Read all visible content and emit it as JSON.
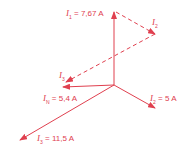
{
  "diagram": {
    "title": "",
    "color": "#e0404f",
    "origin": [
      114,
      85
    ],
    "vectors": [
      {
        "name": "I1",
        "label_sym": "I",
        "label_sub": "1",
        "value": "= 7,67 A",
        "end": [
          114,
          12
        ],
        "style": "solid"
      },
      {
        "name": "I2",
        "label_sym": "I",
        "label_sub": "2",
        "value": "= 5 A",
        "end": [
          155,
          108
        ],
        "style": "solid"
      },
      {
        "name": "I3",
        "label_sym": "I",
        "label_sub": "3",
        "value": "= 11,5 A",
        "end": [
          20,
          140
        ],
        "style": "solid"
      },
      {
        "name": "IN",
        "label_sym": "I",
        "label_sub": "N",
        "value": "= 5,4 A",
        "end": [
          63,
          87
        ],
        "style": "solid"
      }
    ],
    "construction": [
      {
        "name": "I2-shifted",
        "label_sym": "I",
        "label_sub": "2",
        "start": [
          116,
          12
        ],
        "end": [
          155,
          34
        ],
        "style": "dashed"
      },
      {
        "name": "I3-shifted",
        "label_sym": "I",
        "label_sub": "3",
        "start": [
          155,
          34
        ],
        "end": [
          66,
          82
        ],
        "style": "dashed"
      }
    ]
  }
}
